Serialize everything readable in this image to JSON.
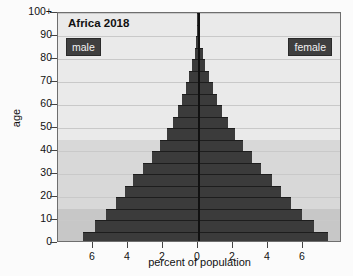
{
  "chart_data": {
    "type": "bar",
    "title": "Africa 2018",
    "subtitle": "",
    "xlabel": "percent of population",
    "ylabel": "age",
    "orientation": "population-pyramid",
    "xlim": [
      -7.8,
      7.8
    ],
    "xtick_labels": [
      "6",
      "4",
      "2",
      "0",
      "2",
      "4",
      "6"
    ],
    "xtick_values": [
      -6,
      -4,
      -2,
      0,
      2,
      4,
      6
    ],
    "ylim": [
      0,
      100
    ],
    "ytick_labels": [
      "0",
      "10",
      "20",
      "30",
      "40",
      "50",
      "60",
      "70",
      "80",
      "90",
      "100+"
    ],
    "ytick_values": [
      0,
      10,
      20,
      30,
      40,
      50,
      60,
      70,
      80,
      90,
      100
    ],
    "grid": true,
    "legend_position": "inside-top-left-and-top-right",
    "age_groups": [
      "0-4",
      "5-9",
      "10-14",
      "15-19",
      "20-24",
      "25-29",
      "30-34",
      "35-39",
      "40-44",
      "45-49",
      "50-54",
      "55-59",
      "60-64",
      "65-69",
      "70-74",
      "75-79",
      "80-84",
      "85-89",
      "90-94",
      "95-99",
      "100+"
    ],
    "series": [
      {
        "name": "male",
        "color": "#3b3b3b",
        "side": "left",
        "values": [
          6.55,
          5.9,
          5.25,
          4.7,
          4.2,
          3.7,
          3.15,
          2.65,
          2.2,
          1.8,
          1.45,
          1.15,
          0.92,
          0.7,
          0.5,
          0.33,
          0.2,
          0.1,
          0.05,
          0.02,
          0.01
        ]
      },
      {
        "name": "female",
        "color": "#3b3b3b",
        "side": "right",
        "values": [
          7.45,
          6.6,
          5.95,
          5.3,
          4.75,
          4.2,
          3.62,
          3.1,
          2.58,
          2.12,
          1.72,
          1.38,
          1.1,
          0.85,
          0.62,
          0.42,
          0.26,
          0.14,
          0.06,
          0.02,
          0.01
        ]
      }
    ],
    "shaded_bands": [
      {
        "from_age": 0,
        "to_age": 15,
        "color": "#c7c7c7",
        "label": "children"
      },
      {
        "from_age": 15,
        "to_age": 45,
        "color": "#d8d8d8",
        "label": "reproductive"
      },
      {
        "from_age": 45,
        "to_age": 100,
        "color": "#eaeaea",
        "label": "post-reproductive"
      }
    ],
    "colors": {
      "plot_background": "#ededed",
      "bar": "#3b3b3b",
      "gridline": "#c9c9c9",
      "axis": "#111111",
      "frame": "#6e6e6e",
      "legend_chip_bg": "#3f3f3f",
      "legend_chip_text": "#f2f2f2"
    }
  },
  "legend": {
    "male_label": "male",
    "female_label": "female"
  }
}
